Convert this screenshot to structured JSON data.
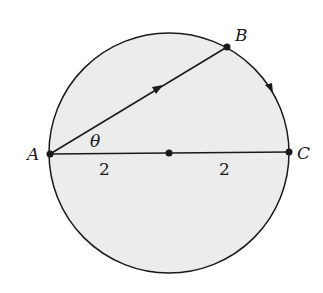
{
  "diagram": {
    "type": "circle-geometry",
    "colors": {
      "background": "#ffffff",
      "circle_fill": "#ececec",
      "stroke": "#1a1a1a"
    },
    "circle": {
      "center": [
        169,
        153
      ],
      "radius": 120
    },
    "points": {
      "A": {
        "label": "A",
        "pos": [
          50,
          154
        ]
      },
      "B": {
        "label": "B",
        "pos": [
          227,
          47
        ]
      },
      "C": {
        "label": "C",
        "pos": [
          289,
          152
        ]
      },
      "O": {
        "label": "",
        "pos": [
          169,
          153
        ]
      }
    },
    "segments": [
      {
        "from": "A",
        "to": "B",
        "arrow": true
      },
      {
        "from": "A",
        "to": "C",
        "arrow": false
      }
    ],
    "arc": {
      "from": "B",
      "to": "C",
      "direction": "clockwise",
      "arrow": true
    },
    "angle_label": "θ",
    "length_labels": [
      "2",
      "2"
    ]
  }
}
